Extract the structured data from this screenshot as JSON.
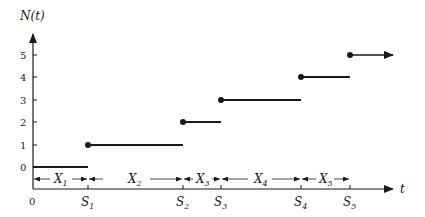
{
  "diagram": {
    "y_axis_label": "N(t)",
    "x_axis_label": "t",
    "origin_label": "0",
    "y_ticks": [
      "0",
      "1",
      "2",
      "3",
      "4",
      "5"
    ],
    "arrival_labels": [
      {
        "main": "S",
        "sub": "1"
      },
      {
        "main": "S",
        "sub": "2"
      },
      {
        "main": "S",
        "sub": "3"
      },
      {
        "main": "S",
        "sub": "4"
      },
      {
        "main": "S",
        "sub": "5"
      }
    ],
    "interarrival_labels": [
      {
        "main": "X",
        "sub": "1"
      },
      {
        "main": "X",
        "sub": "2"
      },
      {
        "main": "X",
        "sub": "3"
      },
      {
        "main": "X",
        "sub": "4"
      },
      {
        "main": "X",
        "sub": "5"
      }
    ],
    "steps": [
      {
        "level": 0,
        "from": "0",
        "to": "S1"
      },
      {
        "level": 1,
        "from": "S1",
        "to": "S2"
      },
      {
        "level": 2,
        "from": "S2",
        "to": "S3"
      },
      {
        "level": 3,
        "from": "S3",
        "to": "S4"
      },
      {
        "level": 4,
        "from": "S4",
        "to": "S5"
      },
      {
        "level": 5,
        "from": "S5",
        "to": "continues"
      }
    ],
    "colors": {
      "ink": "#1a1a1a"
    }
  }
}
